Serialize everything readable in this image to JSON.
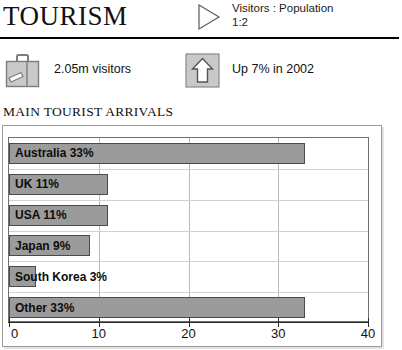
{
  "header": {
    "title": "TOURISM",
    "ratio_icon": "play-triangle-icon",
    "ratio_line1": "Visitors : Population",
    "ratio_line2": "1:2"
  },
  "stats": [
    {
      "icon": "suitcase-icon",
      "label": "2.05m visitors"
    },
    {
      "icon": "up-arrow-icon",
      "label": "Up 7% in 2002"
    }
  ],
  "section": {
    "heading": "MAIN TOURIST ARRIVALS"
  },
  "colors": {
    "bar_fill": "#9b9b9b",
    "bar_border": "#4a4a4a",
    "gridline": "#b9b9b9",
    "panel_border": "#9a9a9a",
    "text": "#111111"
  },
  "chart_data": {
    "type": "bar",
    "orientation": "horizontal",
    "title": "MAIN TOURIST ARRIVALS",
    "xlabel": "",
    "ylabel": "",
    "xlim": [
      0,
      40
    ],
    "xticks": [
      0,
      10,
      20,
      30,
      40
    ],
    "xtick_labels": [
      "0",
      "10",
      "20",
      "30",
      "40"
    ],
    "grid": true,
    "legend": false,
    "unit": "%",
    "categories": [
      "Australia",
      "UK",
      "USA",
      "Japan",
      "South Korea",
      "Other"
    ],
    "values": [
      33,
      11,
      11,
      9,
      3,
      33
    ],
    "bar_labels": [
      "Australia 33%",
      "UK 11%",
      "USA 11%",
      "Japan 9%",
      "South Korea 3%",
      "Other 33%"
    ]
  }
}
